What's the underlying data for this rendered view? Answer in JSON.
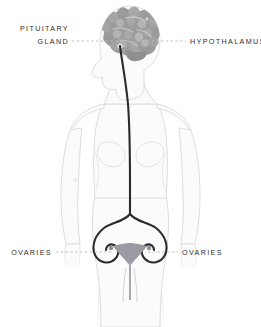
{
  "diagram": {
    "background_color": "#ffffff",
    "body_outline_color": "#d9d9d9",
    "body_fill_color": "#fbfbfb",
    "brain_color": "#9d9d9d",
    "brain_shade_color": "#b4b4b4",
    "pathway_color": "#2b2b2b",
    "uterus_color": "#9a9aa2",
    "leader_color": "#b9b9b9",
    "text_color": "#2e2e2e"
  },
  "labels": {
    "pituitary": {
      "line1": "PITUITARY",
      "line2": "GLAND",
      "side": "left"
    },
    "hypothalamus": {
      "text": "HYPOTHALAMUS",
      "side": "right"
    },
    "ovaries_left": {
      "text": "OVARIES",
      "side": "left"
    },
    "ovaries_right": {
      "text": "OVARIES",
      "side": "right"
    }
  }
}
